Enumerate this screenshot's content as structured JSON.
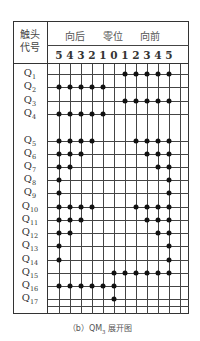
{
  "header": {
    "corner_line1": "触头",
    "corner_line2": "代号",
    "directions": [
      {
        "label": "向后",
        "x": 65
      },
      {
        "label": "零位",
        "x": 103
      },
      {
        "label": "向前",
        "x": 140
      }
    ],
    "positions": [
      {
        "label": "5",
        "x": 59
      },
      {
        "label": "4",
        "x": 70
      },
      {
        "label": "3",
        "x": 81
      },
      {
        "label": "2",
        "x": 92
      },
      {
        "label": "1",
        "x": 103
      },
      {
        "label": "0",
        "x": 114
      },
      {
        "label": "1",
        "x": 125
      },
      {
        "label": "2",
        "x": 136
      },
      {
        "label": "3",
        "x": 147
      },
      {
        "label": "4",
        "x": 158
      },
      {
        "label": "5",
        "x": 169
      }
    ]
  },
  "grid": {
    "vline_x": [
      59,
      70,
      81,
      92,
      103,
      114,
      125,
      136,
      147,
      158,
      169,
      180
    ],
    "extra_hlines_y": [
      306
    ]
  },
  "rows": [
    {
      "name": "Q",
      "sub": "1",
      "y": 74,
      "contacts": [
        6,
        7,
        8,
        9,
        10
      ]
    },
    {
      "name": "Q",
      "sub": "2",
      "y": 87,
      "contacts": [
        0,
        1,
        2,
        3,
        4
      ]
    },
    {
      "name": "Q",
      "sub": "3",
      "y": 101,
      "contacts": [
        6,
        7,
        8,
        9,
        10
      ]
    },
    {
      "name": "Q",
      "sub": "4",
      "y": 114,
      "contacts": [
        0,
        1,
        2,
        3,
        4
      ]
    },
    {
      "name": "Q",
      "sub": "5",
      "y": 141,
      "contacts": [
        0,
        1,
        2,
        3,
        7,
        8,
        9,
        10
      ]
    },
    {
      "name": "Q",
      "sub": "6",
      "y": 154,
      "contacts": [
        0,
        1,
        2,
        8,
        9,
        10
      ]
    },
    {
      "name": "Q",
      "sub": "7",
      "y": 167,
      "contacts": [
        0,
        1,
        9,
        10
      ]
    },
    {
      "name": "Q",
      "sub": "8",
      "y": 180,
      "contacts": [
        0,
        10
      ]
    },
    {
      "name": "Q",
      "sub": "9",
      "y": 193,
      "contacts": [
        0,
        10
      ]
    },
    {
      "name": "Q",
      "sub": "10",
      "y": 207,
      "contacts": [
        0,
        1,
        2,
        3,
        7,
        8,
        9,
        10
      ]
    },
    {
      "name": "Q",
      "sub": "11",
      "y": 220,
      "contacts": [
        0,
        1,
        2,
        8,
        9,
        10
      ]
    },
    {
      "name": "Q",
      "sub": "12",
      "y": 233,
      "contacts": [
        0,
        1,
        9,
        10
      ]
    },
    {
      "name": "Q",
      "sub": "13",
      "y": 246,
      "contacts": [
        0,
        10
      ]
    },
    {
      "name": "Q",
      "sub": "14",
      "y": 260,
      "contacts": [
        0,
        10
      ]
    },
    {
      "name": "Q",
      "sub": "15",
      "y": 273,
      "contacts": [
        5,
        6,
        7,
        8,
        9,
        10
      ]
    },
    {
      "name": "Q",
      "sub": "16",
      "y": 286,
      "contacts": [
        0,
        1,
        2,
        3,
        4,
        5
      ]
    },
    {
      "name": "Q",
      "sub": "17",
      "y": 299,
      "contacts": [
        5
      ]
    }
  ],
  "caption": {
    "prefix": "（b）QM",
    "sub": "3",
    "suffix": " 展开图"
  }
}
